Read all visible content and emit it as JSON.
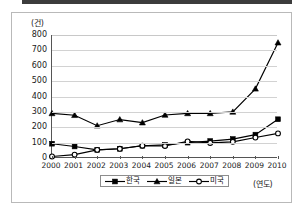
{
  "chart_data": {
    "type": "line",
    "title": "",
    "xlabel": "(연도)",
    "ylabel": "(건)",
    "ylim": [
      0,
      800
    ],
    "ytick_step": 100,
    "grid": true,
    "legend_position": "bottom-center",
    "categories": [
      "2000",
      "2001",
      "2002",
      "2003",
      "2004",
      "2005",
      "2006",
      "2007",
      "2008",
      "2009",
      "2010"
    ],
    "yticks": [
      "800",
      "700",
      "600",
      "500",
      "400",
      "300",
      "200",
      "100",
      "0"
    ],
    "series": [
      {
        "name": "한국",
        "marker": "filled-square",
        "color": "#000000",
        "values": [
          93,
          75,
          53,
          60,
          80,
          85,
          100,
          110,
          123,
          152,
          252
        ]
      },
      {
        "name": "일본",
        "marker": "filled-triangle",
        "color": "#000000",
        "values": [
          290,
          278,
          210,
          250,
          230,
          280,
          290,
          290,
          300,
          450,
          750
        ]
      },
      {
        "name": "미국",
        "marker": "open-circle",
        "color": "#000000",
        "values": [
          10,
          22,
          53,
          60,
          80,
          78,
          108,
          98,
          105,
          133,
          160
        ]
      }
    ]
  },
  "legend": {
    "items": [
      {
        "label": "한국",
        "marker": "filled-square"
      },
      {
        "label": "일본",
        "marker": "filled-triangle"
      },
      {
        "label": "미국",
        "marker": "open-circle"
      }
    ]
  },
  "axes": {
    "y_unit_label": "(건)",
    "x_unit_label": "(연도)"
  }
}
